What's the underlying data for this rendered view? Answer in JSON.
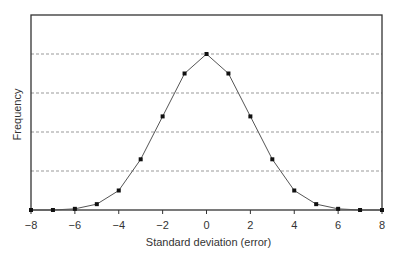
{
  "chart_data": {
    "type": "line",
    "title": "",
    "xlabel": "Standard deviation (error)",
    "ylabel": "Frequency",
    "xlim": [
      -8,
      8
    ],
    "ylim": [
      0,
      4.6
    ],
    "xticks": [
      -8,
      -6,
      -4,
      -2,
      0,
      2,
      4,
      6,
      8
    ],
    "xtick_labels": [
      "−8",
      "−6",
      "−4",
      "−2",
      "0",
      "2",
      "4",
      "6",
      "8"
    ],
    "yticks_gridlines": [
      1,
      2,
      3,
      4
    ],
    "ytick_labels_shown": false,
    "grid": "horizontal dashed",
    "legend": null,
    "series": [
      {
        "name": "Frequency",
        "x": [
          -8,
          -7,
          -6,
          -5,
          -4,
          -3,
          -2,
          -1,
          0,
          1,
          2,
          3,
          4,
          5,
          6,
          7,
          8
        ],
        "values": [
          0,
          0,
          0.03,
          0.15,
          0.5,
          1.3,
          2.4,
          3.5,
          4.0,
          3.5,
          2.4,
          1.3,
          0.5,
          0.15,
          0.03,
          0,
          0
        ]
      }
    ]
  },
  "colors": {
    "line": "#555555",
    "marker": "#111111",
    "frame": "#333333",
    "grid": "#999999"
  }
}
